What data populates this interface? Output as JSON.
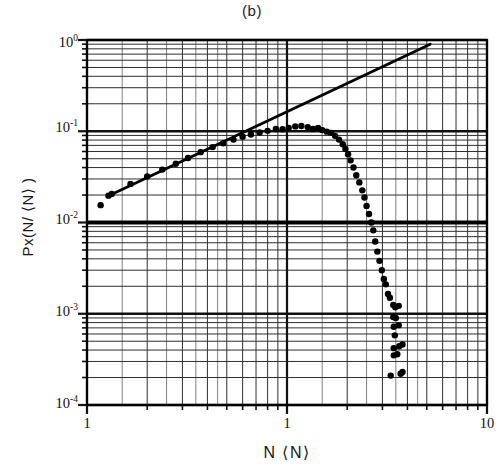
{
  "figure": {
    "title": "(b)",
    "xaxis_title": "N ⟨N⟩",
    "yaxis_title": "Px(N/ ⟨N⟩ )"
  },
  "ticks": {
    "y": [
      {
        "label_mantissa": "10",
        "label_exponent": "0",
        "value": 1
      },
      {
        "label_mantissa": "10",
        "label_exponent": "-1",
        "value": 0.1
      },
      {
        "label_mantissa": "10",
        "label_exponent": "-2",
        "value": 0.01
      },
      {
        "label_mantissa": "10",
        "label_exponent": "-3",
        "value": 0.001
      },
      {
        "label_mantissa": "10",
        "label_exponent": "-4",
        "value": 0.0001
      }
    ],
    "x": [
      {
        "label": "1",
        "value": 0.1
      },
      {
        "label": "1",
        "value": 1
      },
      {
        "label": "10",
        "value": 10
      }
    ]
  },
  "chart_data": {
    "type": "scatter",
    "title": "(b)",
    "subtitle": "",
    "xlabel": "N ⟨N⟩",
    "ylabel": "Px(N/ ⟨N⟩ )",
    "xscale": "log",
    "yscale": "log",
    "xlim": [
      0.1,
      10
    ],
    "ylim": [
      0.0001,
      1
    ],
    "grid": true,
    "grid_style": "log-log graph paper, minor decade subdivisions",
    "legend": null,
    "series": [
      {
        "name": "Px(N/<N>) data",
        "type": "scatter",
        "marker": "filled-circle",
        "color": "#000000",
        "points": [
          [
            0.117,
            0.0155
          ],
          [
            0.128,
            0.0197
          ],
          [
            0.133,
            0.0205
          ],
          [
            0.165,
            0.0265
          ],
          [
            0.2,
            0.032
          ],
          [
            0.238,
            0.038
          ],
          [
            0.278,
            0.044
          ],
          [
            0.32,
            0.051
          ],
          [
            0.37,
            0.059
          ],
          [
            0.425,
            0.067
          ],
          [
            0.48,
            0.074
          ],
          [
            0.54,
            0.081
          ],
          [
            0.6,
            0.087
          ],
          [
            0.66,
            0.092
          ],
          [
            0.73,
            0.097
          ],
          [
            0.8,
            0.101
          ],
          [
            0.88,
            0.106
          ],
          [
            0.95,
            0.105
          ],
          [
            1.02,
            0.109
          ],
          [
            1.1,
            0.113
          ],
          [
            1.18,
            0.114
          ],
          [
            1.27,
            0.111
          ],
          [
            1.35,
            0.106
          ],
          [
            1.43,
            0.109
          ],
          [
            1.5,
            0.103
          ],
          [
            1.58,
            0.099
          ],
          [
            1.66,
            0.096
          ],
          [
            1.74,
            0.089
          ],
          [
            1.82,
            0.081
          ],
          [
            1.9,
            0.072
          ],
          [
            1.96,
            0.064
          ],
          [
            2.02,
            0.056
          ],
          [
            2.08,
            0.048
          ],
          [
            2.15,
            0.04
          ],
          [
            2.22,
            0.033
          ],
          [
            2.3,
            0.0275
          ],
          [
            2.38,
            0.0225
          ],
          [
            2.44,
            0.0188
          ],
          [
            2.5,
            0.0152
          ],
          [
            2.57,
            0.0124
          ],
          [
            2.64,
            0.01
          ],
          [
            2.7,
            0.0082
          ],
          [
            2.76,
            0.0062
          ],
          [
            2.83,
            0.0048
          ],
          [
            2.9,
            0.0038
          ],
          [
            2.98,
            0.003
          ],
          [
            3.05,
            0.0024
          ],
          [
            3.12,
            0.0021
          ],
          [
            3.2,
            0.00165
          ],
          [
            3.27,
            0.0015
          ],
          [
            3.4,
            0.00125
          ],
          [
            3.48,
            0.00118
          ],
          [
            3.62,
            0.00122
          ],
          [
            3.4,
            0.00092
          ],
          [
            3.5,
            0.0009
          ],
          [
            3.42,
            0.00072
          ],
          [
            3.62,
            0.00075
          ],
          [
            3.46,
            0.00058
          ],
          [
            3.42,
            0.00042
          ],
          [
            3.64,
            0.00044
          ],
          [
            3.78,
            0.00046
          ],
          [
            3.42,
            0.00035
          ],
          [
            3.56,
            0.00036
          ],
          [
            3.3,
            0.00021
          ],
          [
            3.7,
            0.00022
          ],
          [
            3.78,
            0.00023
          ]
        ]
      },
      {
        "name": "power-law fit line",
        "type": "line",
        "color": "#000000",
        "endpoints": [
          [
            0.134,
            0.0205
          ],
          [
            5.2,
            0.9
          ]
        ],
        "note": "straight line on log-log axes"
      }
    ]
  }
}
